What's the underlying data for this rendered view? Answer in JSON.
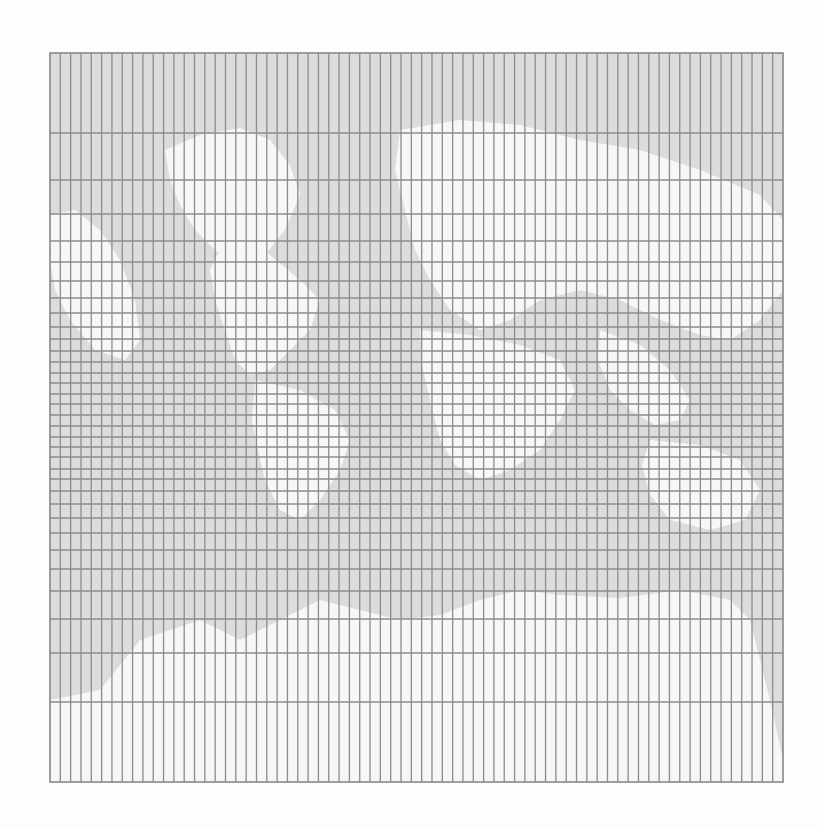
{
  "map": {
    "frame": {
      "x": 50,
      "y": 53,
      "width": 733,
      "height": 729
    },
    "colors": {
      "page_background": "#fdfdfd",
      "water": "#dcdcdc",
      "land": "#f7f7f7",
      "gridline": "#8c8c8c",
      "border": "#888888"
    },
    "graticule": {
      "columns": 71,
      "column_spacing_px": 10.32,
      "horizontal_lines_y": [
        133,
        180,
        214,
        241,
        262,
        281,
        298,
        313,
        327,
        339,
        351,
        362,
        373,
        383,
        394,
        404,
        415,
        426,
        437,
        447,
        457,
        469,
        479,
        491,
        504,
        518,
        533,
        550,
        569,
        591,
        619,
        653,
        702
      ]
    },
    "land_shapes": [
      {
        "name": "greenland-north-landmass",
        "points": "165,150 200,135 240,128 270,140 290,165 300,195 285,230 265,255 240,265 215,250 195,230 180,205 170,180"
      },
      {
        "name": "north-america-landmass",
        "points": "230,230 270,255 300,280 320,300 310,330 290,350 270,370 250,375 235,360 225,330 215,300 210,270"
      },
      {
        "name": "western-landmass",
        "points": "50,215 75,210 100,230 120,260 135,300 140,340 125,360 95,350 70,320 55,290 50,260"
      },
      {
        "name": "south-america-landmass",
        "points": "255,380 300,390 335,410 350,440 340,470 320,500 300,520 280,510 265,480 258,450 252,420"
      },
      {
        "name": "eurasia-landmass",
        "points": "400,130 460,120 520,125 580,140 640,150 700,170 760,195 783,220 783,290 760,320 730,340 700,335 660,320 620,300 580,290 540,300 510,320 480,330 450,310 430,280 415,250 405,210 395,170"
      },
      {
        "name": "africa-landmass",
        "points": "420,330 470,335 520,345 560,360 575,390 560,420 540,450 510,470 480,480 455,465 440,440 430,400 422,365"
      },
      {
        "name": "southeast-asia-landmass",
        "points": "600,330 640,345 670,370 690,400 680,420 655,425 630,410 610,390 598,360"
      },
      {
        "name": "australia-landmass",
        "points": "650,440 700,445 740,460 760,490 745,520 710,530 670,520 650,495 642,465"
      },
      {
        "name": "antarctica-landmass",
        "points": "50,700 100,690 140,640 200,620 240,640 280,620 320,600 360,610 400,620 440,615 480,600 520,590 560,595 620,598 680,590 730,600 750,620 760,660 770,700 783,760 783,782 50,782"
      }
    ]
  }
}
